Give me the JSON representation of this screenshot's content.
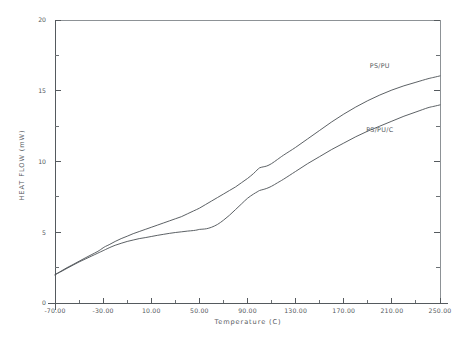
{
  "chart_data": {
    "type": "line",
    "title": "",
    "xlabel": "Temperature (C)",
    "ylabel": "HEAT FLOW  (mW)",
    "xlim": [
      -70,
      250
    ],
    "ylim": [
      0,
      20
    ],
    "grid": false,
    "legend_position": "inline-annotation",
    "x_tick_labels": [
      "-70.00",
      "-30.00",
      "10.00",
      "50.00",
      "90.00",
      "130.00",
      "170.00",
      "210.00",
      "250.00"
    ],
    "x_tick_values": [
      -70,
      -30,
      10,
      50,
      90,
      130,
      170,
      210,
      250
    ],
    "y_tick_labels": [
      "0",
      "5",
      "10",
      "15",
      "20"
    ],
    "y_tick_values": [
      0,
      5,
      10,
      15,
      20
    ],
    "x_minor_tick_count_per_interval": 1,
    "y_minor_tick_count_per_interval": 1,
    "series": [
      {
        "name": "PS/PU",
        "annotation": "PS/PU",
        "annotation_x": 200,
        "annotation_y": 16.6,
        "x": [
          -70,
          -65,
          -60,
          -55,
          -50,
          -45,
          -40,
          -35,
          -32,
          -30,
          -28,
          -25,
          -20,
          -15,
          -10,
          -5,
          0,
          5,
          10,
          15,
          20,
          25,
          30,
          35,
          40,
          45,
          50,
          55,
          60,
          65,
          70,
          75,
          80,
          85,
          90,
          95,
          98,
          100,
          103,
          106,
          110,
          115,
          120,
          130,
          140,
          150,
          160,
          170,
          180,
          190,
          200,
          210,
          220,
          230,
          240,
          245,
          250
        ],
        "y": [
          2.0,
          2.25,
          2.5,
          2.72,
          2.95,
          3.18,
          3.4,
          3.62,
          3.78,
          3.9,
          4.0,
          4.12,
          4.35,
          4.55,
          4.72,
          4.9,
          5.05,
          5.2,
          5.35,
          5.5,
          5.65,
          5.8,
          5.95,
          6.1,
          6.3,
          6.5,
          6.7,
          6.95,
          7.2,
          7.45,
          7.7,
          7.95,
          8.2,
          8.5,
          8.8,
          9.15,
          9.4,
          9.55,
          9.62,
          9.68,
          9.85,
          10.15,
          10.45,
          11.0,
          11.6,
          12.2,
          12.8,
          13.35,
          13.85,
          14.3,
          14.7,
          15.05,
          15.35,
          15.6,
          15.85,
          15.95,
          16.05
        ]
      },
      {
        "name": "PS/PU/C",
        "annotation": "PS/PU/C",
        "annotation_x": 200,
        "annotation_y": 12.1,
        "x": [
          -70,
          -65,
          -60,
          -55,
          -50,
          -45,
          -40,
          -35,
          -32,
          -30,
          -28,
          -25,
          -20,
          -15,
          -10,
          -5,
          0,
          5,
          10,
          15,
          20,
          25,
          30,
          35,
          40,
          45,
          48,
          50,
          53,
          56,
          60,
          65,
          70,
          75,
          80,
          85,
          90,
          95,
          98,
          100,
          103,
          106,
          110,
          115,
          120,
          130,
          140,
          150,
          160,
          170,
          180,
          190,
          200,
          210,
          220,
          230,
          240,
          245,
          250
        ],
        "y": [
          2.0,
          2.22,
          2.45,
          2.68,
          2.9,
          3.1,
          3.3,
          3.5,
          3.62,
          3.7,
          3.78,
          3.9,
          4.08,
          4.22,
          4.35,
          4.45,
          4.55,
          4.62,
          4.7,
          4.78,
          4.85,
          4.92,
          4.98,
          5.03,
          5.08,
          5.12,
          5.16,
          5.2,
          5.22,
          5.25,
          5.35,
          5.55,
          5.85,
          6.2,
          6.6,
          7.0,
          7.4,
          7.7,
          7.85,
          7.95,
          8.02,
          8.1,
          8.25,
          8.5,
          8.75,
          9.3,
          9.85,
          10.35,
          10.85,
          11.3,
          11.75,
          12.15,
          12.5,
          12.85,
          13.2,
          13.5,
          13.8,
          13.9,
          14.0
        ]
      }
    ]
  },
  "figure": {
    "background_color": "#ffffff",
    "line_color": "#4a4f54",
    "axis_color": "#555a5e",
    "text_color": "#55595d"
  }
}
